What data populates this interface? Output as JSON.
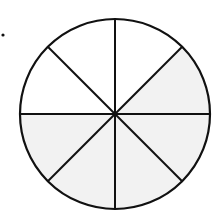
{
  "diagram": {
    "type": "fraction-circle",
    "total_slices": 8,
    "shaded_slices": 5,
    "fraction_shaded": "5/8",
    "colors": {
      "shaded": "#f2f2f2",
      "unshaded": "#ffffff",
      "stroke": "#111111"
    },
    "slices": [
      {
        "index": 0,
        "from_deg": 0,
        "to_deg": 45,
        "shaded": true
      },
      {
        "index": 1,
        "from_deg": 45,
        "to_deg": 90,
        "shaded": false
      },
      {
        "index": 2,
        "from_deg": 90,
        "to_deg": 135,
        "shaded": false
      },
      {
        "index": 3,
        "from_deg": 135,
        "to_deg": 180,
        "shaded": false
      },
      {
        "index": 4,
        "from_deg": 180,
        "to_deg": 225,
        "shaded": true
      },
      {
        "index": 5,
        "from_deg": 225,
        "to_deg": 270,
        "shaded": true
      },
      {
        "index": 6,
        "from_deg": 270,
        "to_deg": 315,
        "shaded": true
      },
      {
        "index": 7,
        "from_deg": 315,
        "to_deg": 360,
        "shaded": true
      }
    ]
  }
}
